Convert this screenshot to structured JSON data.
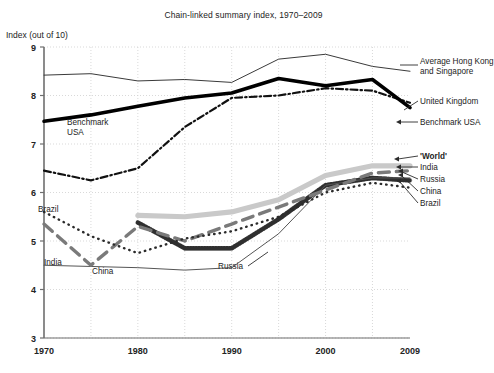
{
  "chart_data": {
    "type": "line",
    "title": "Chain-linked summary index, 1970–2009",
    "ylabel": "Index (out of 10)",
    "xlabel": "",
    "xlim": [
      1970,
      2009
    ],
    "ylim": [
      3,
      9
    ],
    "yticks": [
      3,
      4,
      5,
      6,
      7,
      8,
      9
    ],
    "xticks": [
      1970,
      1980,
      1990,
      2000,
      2009
    ],
    "xtick_labels": [
      "1970",
      "1980",
      "1990",
      "2000",
      "2009"
    ],
    "ytick_labels": [
      "3",
      "4",
      "5",
      "6",
      "7",
      "8",
      "9"
    ],
    "grid": true,
    "legend_position": "right-of-axes (direct labels)",
    "series": [
      {
        "name": "Average Hong Kong and Singapore",
        "style": "thin-solid",
        "color": "#3a3a3a",
        "x": [
          1970,
          1975,
          1980,
          1985,
          1990,
          1995,
          2000,
          2005,
          2009
        ],
        "values": [
          8.42,
          8.45,
          8.3,
          8.33,
          8.27,
          8.75,
          8.85,
          8.6,
          8.5
        ]
      },
      {
        "name": "Benchmark USA",
        "style": "thick-solid",
        "color": "#000000",
        "x": [
          1970,
          1975,
          1980,
          1985,
          1990,
          1995,
          2000,
          2005,
          2009
        ],
        "values": [
          7.47,
          7.6,
          7.78,
          7.95,
          8.05,
          8.35,
          8.2,
          8.33,
          7.75
        ]
      },
      {
        "name": "United Kingdom",
        "style": "dash-dot",
        "color": "#111111",
        "x": [
          1970,
          1975,
          1980,
          1985,
          1990,
          1995,
          2000,
          2005,
          2009
        ],
        "values": [
          6.45,
          6.25,
          6.5,
          7.35,
          7.95,
          8.0,
          8.15,
          8.1,
          7.85
        ]
      },
      {
        "name": "'World'",
        "style": "thick-light-gray",
        "color": "#c9c9c9",
        "x": [
          1980,
          1985,
          1990,
          1995,
          2000,
          2005,
          2009
        ],
        "values": [
          5.53,
          5.5,
          5.6,
          5.85,
          6.35,
          6.55,
          6.55
        ]
      },
      {
        "name": "India",
        "style": "long-dash",
        "color": "#7a7a7a",
        "x": [
          1970,
          1975,
          1980,
          1985,
          1990,
          1995,
          2000,
          2005,
          2009
        ],
        "values": [
          5.35,
          4.5,
          5.3,
          5.0,
          5.35,
          5.7,
          6.05,
          6.4,
          6.45
        ]
      },
      {
        "name": "Russia",
        "style": "thin-solid-light",
        "color": "#555555",
        "x": [
          1970,
          1980,
          1985,
          1990,
          1995,
          2000,
          2005,
          2009
        ],
        "values": [
          4.5,
          4.45,
          4.4,
          4.45,
          5.15,
          6.15,
          6.3,
          6.3
        ]
      },
      {
        "name": "China",
        "style": "hatched-band",
        "color": "#4a4a4a",
        "x": [
          1980,
          1985,
          1990,
          1995,
          2000,
          2005,
          2009
        ],
        "values": [
          5.38,
          4.85,
          4.85,
          5.45,
          6.15,
          6.3,
          6.25
        ]
      },
      {
        "name": "Brazil",
        "style": "dotted",
        "color": "#2b2b2b",
        "x": [
          1970,
          1975,
          1980,
          1985,
          1990,
          1995,
          2000,
          2005,
          2009
        ],
        "values": [
          5.6,
          5.1,
          4.75,
          5.05,
          5.2,
          5.5,
          6.0,
          6.2,
          6.1
        ]
      }
    ],
    "right_labels": [
      {
        "text": "Average Hong Kong",
        "text2": "and Singapore"
      },
      {
        "text": "United Kingdom"
      },
      {
        "text": "Benchmark USA"
      },
      {
        "text": "'World'"
      },
      {
        "text": "India"
      },
      {
        "text": "Russia"
      },
      {
        "text": "China"
      },
      {
        "text": "Brazil"
      }
    ],
    "inline_annotations": [
      {
        "text": "Benchmark",
        "text2": "USA"
      },
      {
        "text": "Brazil"
      },
      {
        "text": "India"
      },
      {
        "text": "China"
      },
      {
        "text": "Russia"
      }
    ]
  },
  "labels": {
    "title": "Chain-linked summary index, 1970–2009",
    "ylabel": "Index (out of 10)",
    "right": {
      "hk_sg_line1": "Average Hong Kong",
      "hk_sg_line2": "and Singapore",
      "uk": "United Kingdom",
      "usa": "Benchmark USA",
      "world": "'World'",
      "india": "India",
      "russia": "Russia",
      "china": "China",
      "brazil": "Brazil"
    },
    "inline": {
      "usa_line1": "Benchmark",
      "usa_line2": "USA",
      "brazil": "Brazil",
      "india": "India",
      "china": "China",
      "russia": "Russia"
    }
  },
  "colors": {
    "axis": "#6f6f6f",
    "grid": "#cfcfcf",
    "text": "#232323",
    "world": "#c9c9c9",
    "india": "#7a7a7a",
    "china": "#4a4a4a",
    "usa": "#000000"
  }
}
